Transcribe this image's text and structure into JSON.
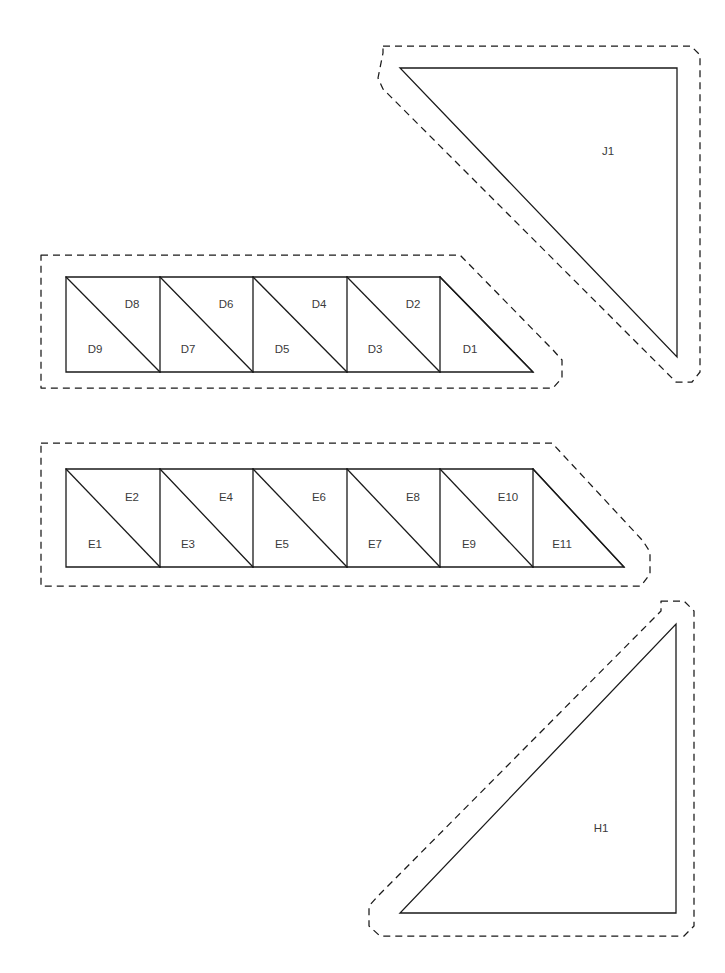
{
  "document": {
    "type": "quilting-pattern-cutting-layout",
    "background_color": "#ffffff",
    "line_color": "#1a1a1a",
    "label_color": "#3b3b3b",
    "width": 725,
    "height": 973
  },
  "groups": [
    {
      "id": "J",
      "name": "unit-j",
      "shape": "large-right-triangle",
      "seam_allowance": "dashed",
      "pieces": [
        {
          "label": "J1",
          "label_x": 608,
          "label_y": 152
        }
      ],
      "outline_points": "400,68 677,68 677,357",
      "dash_points": "383,46 691,46 700,55 700,372 692,382 676,382 666,372 383,89 378,78 383,53"
    },
    {
      "id": "D",
      "name": "unit-d-strip",
      "shape": "half-square-triangle-strip",
      "seam_allowance": "dashed",
      "square_count": 4,
      "end_triangle": true,
      "pieces": [
        {
          "label": "D9",
          "label_x": 95,
          "label_y": 350
        },
        {
          "label": "D8",
          "label_x": 132,
          "label_y": 305
        },
        {
          "label": "D7",
          "label_x": 188,
          "label_y": 350
        },
        {
          "label": "D6",
          "label_x": 226,
          "label_y": 305
        },
        {
          "label": "D5",
          "label_x": 282,
          "label_y": 350
        },
        {
          "label": "D4",
          "label_x": 319,
          "label_y": 305
        },
        {
          "label": "D3",
          "label_x": 375,
          "label_y": 350
        },
        {
          "label": "D2",
          "label_x": 413,
          "label_y": 305
        },
        {
          "label": "D1",
          "label_x": 470,
          "label_y": 350
        }
      ],
      "outline_points": "66,277 440,277 533,372 66,372",
      "dividers": [
        "66,277 160,372",
        "160,277 253,372",
        "253,277 347,372",
        "347,277 440,372",
        "440,277 533,372",
        "160,277 160,372",
        "253,277 253,372",
        "347,277 347,372",
        "440,277 440,372"
      ],
      "dash_points": "41,255 460,255 553,350 562,360 562,378 553,388 41,388 41,255"
    },
    {
      "id": "E",
      "name": "unit-e-strip",
      "shape": "half-square-triangle-strip",
      "seam_allowance": "dashed",
      "square_count": 5,
      "end_triangle": true,
      "pieces": [
        {
          "label": "E1",
          "label_x": 95,
          "label_y": 545
        },
        {
          "label": "E2",
          "label_x": 132,
          "label_y": 498
        },
        {
          "label": "E3",
          "label_x": 188,
          "label_y": 545
        },
        {
          "label": "E4",
          "label_x": 226,
          "label_y": 498
        },
        {
          "label": "E5",
          "label_x": 282,
          "label_y": 545
        },
        {
          "label": "E6",
          "label_x": 319,
          "label_y": 498
        },
        {
          "label": "E7",
          "label_x": 375,
          "label_y": 545
        },
        {
          "label": "E8",
          "label_x": 413,
          "label_y": 498
        },
        {
          "label": "E9",
          "label_x": 469,
          "label_y": 545
        },
        {
          "label": "E10",
          "label_x": 508,
          "label_y": 498
        },
        {
          "label": "E11",
          "label_x": 562,
          "label_y": 545
        }
      ],
      "outline_points": "66,469 533,469 624,567 66,567",
      "dividers": [
        "66,469 160,567",
        "160,469 253,567",
        "253,469 347,567",
        "347,469 440,567",
        "440,469 533,567",
        "533,469 624,567",
        "160,469 160,567",
        "253,469 253,567",
        "347,469 347,567",
        "440,469 440,567",
        "533,469 533,567"
      ],
      "dash_points": "41,443 552,443 643,541 650,552 650,574 641,586 41,586 41,443"
    },
    {
      "id": "H",
      "name": "unit-h",
      "shape": "large-right-triangle",
      "seam_allowance": "dashed",
      "pieces": [
        {
          "label": "H1",
          "label_x": 601,
          "label_y": 829
        }
      ],
      "outline_points": "676,624 676,913 400,913",
      "dash_points": "661,601 684,601 694,611 694,926 684,936 380,936 369,926 369,906 378,896 661,611"
    }
  ]
}
